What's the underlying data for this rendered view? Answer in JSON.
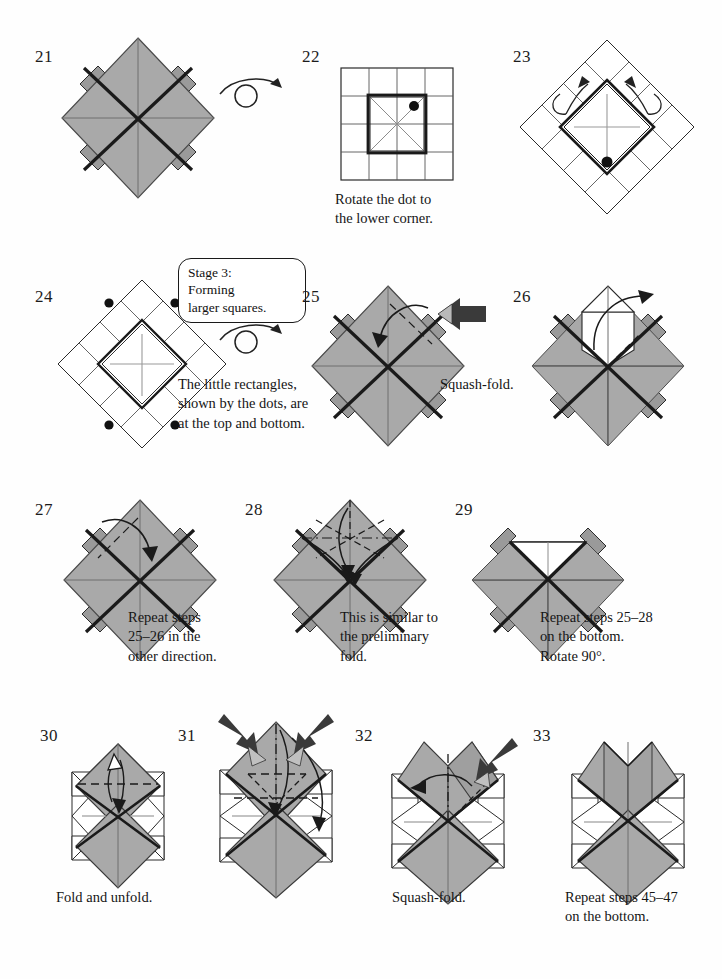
{
  "page": {
    "kind": "origami-instruction-diagrams",
    "background": "#ffffff",
    "paper_front_color": "#a9a9a9",
    "paper_back_color": "#ffffff",
    "line_color": "#1a1a1a",
    "crease_color": "#8c8c8c"
  },
  "stage_callout": {
    "text": "Stage 3:\nForming\nlarger squares."
  },
  "steps": [
    {
      "number": "21",
      "caption": "",
      "symbols": [
        "turn-over-arrow"
      ]
    },
    {
      "number": "22",
      "caption": "Rotate the dot to\nthe lower corner.",
      "symbols": [
        "dot-marker"
      ]
    },
    {
      "number": "23",
      "caption": "",
      "symbols": [
        "dot-marker",
        "fold-arrow",
        "fold-arrow"
      ]
    },
    {
      "number": "24",
      "caption": "The little rectangles,\nshown by the dots, are\nat the top and bottom.",
      "symbols": [
        "dot-marker",
        "dot-marker",
        "dot-marker",
        "dot-marker",
        "turn-over-arrow"
      ]
    },
    {
      "number": "25",
      "caption": "Squash-fold.",
      "symbols": [
        "push-arrow",
        "fold-arrow"
      ]
    },
    {
      "number": "26",
      "caption": "",
      "symbols": [
        "fold-arrow"
      ]
    },
    {
      "number": "27",
      "caption": "Repeat steps\n25–26 in the\nother direction.",
      "symbols": [
        "fold-arrow"
      ]
    },
    {
      "number": "28",
      "caption": "This is similar to\nthe preliminary\nfold.",
      "symbols": [
        "fold-arrow",
        "fold-arrow",
        "fold-arrow"
      ]
    },
    {
      "number": "29",
      "caption": "Repeat steps 25–28\non the bottom.\nRotate 90°.",
      "symbols": []
    },
    {
      "number": "30",
      "caption": "Fold and unfold.",
      "symbols": [
        "fold-unfold-arrow"
      ]
    },
    {
      "number": "31",
      "caption": "",
      "symbols": [
        "push-arrow",
        "push-arrow",
        "fold-arrow",
        "fold-arrow"
      ]
    },
    {
      "number": "32",
      "caption": "Squash-fold.",
      "symbols": [
        "push-arrow",
        "fold-arrow"
      ]
    },
    {
      "number": "33",
      "caption": "Repeat steps 45–47\non the bottom.",
      "symbols": []
    }
  ]
}
